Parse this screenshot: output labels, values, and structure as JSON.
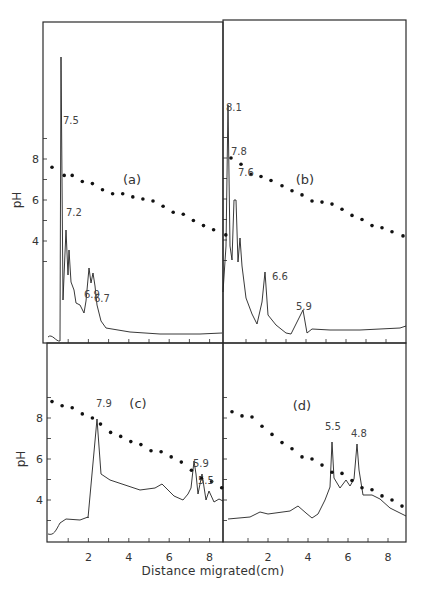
{
  "figure": {
    "xlabel": "Distance migrated(cm)",
    "ylabel": "pH"
  },
  "chart_data": [
    {
      "type": "line",
      "panel": "(a)",
      "title": "(a)",
      "xlabel": "Distance migrated (cm)",
      "ylabel": "pH",
      "ylim": [
        1.2,
        12.7
      ],
      "xlim": [
        0,
        9
      ],
      "yticks": [
        4,
        6,
        8
      ],
      "xticks": [
        2,
        4,
        6,
        8
      ],
      "peak_labels": [
        {
          "label": "7.5",
          "x": 0.7,
          "y_frac": 0.13
        },
        {
          "label": "7.2",
          "x": 1.2,
          "y_frac": 0.42
        },
        {
          "label": "6.9",
          "x": 2.2,
          "y_frac": 0.61
        },
        {
          "label": "6.7",
          "x": 2.5,
          "y_frac": 0.61
        }
      ],
      "series": [
        {
          "name": "pH gradient",
          "style": "dots",
          "x": [
            0.2,
            0.8,
            1.2,
            1.7,
            2.2,
            2.7,
            3.2,
            3.7,
            4.2,
            4.7,
            5.2,
            5.7,
            6.2,
            6.7,
            7.2,
            7.7,
            8.2,
            8.8
          ],
          "y": [
            7.6,
            7.2,
            7.2,
            6.9,
            6.8,
            6.5,
            6.3,
            6.3,
            6.15,
            6.05,
            5.95,
            5.7,
            5.4,
            5.3,
            5.0,
            4.75,
            4.55,
            4.3
          ]
        },
        {
          "name": "Absorbance trace",
          "style": "line"
        }
      ]
    },
    {
      "type": "line",
      "panel": "(b)",
      "title": "(b)",
      "xlabel": "Distance migrated (cm)",
      "ylabel": "pH",
      "xlim": [
        0,
        9
      ],
      "yticks": [
        4,
        6,
        8
      ],
      "xticks": [
        2,
        4,
        6,
        8
      ],
      "peak_labels": [
        {
          "label": "8.1",
          "x": 0.3
        },
        {
          "label": "7.8",
          "x": 0.8
        },
        {
          "label": "7.6",
          "x": 1.2
        },
        {
          "label": "6.6",
          "x": 2.4
        },
        {
          "label": "5.9",
          "x": 3.9
        }
      ],
      "series": [
        {
          "name": "pH gradient",
          "style": "dots",
          "x": [
            0.25,
            0.75,
            1.25,
            1.75,
            2.25,
            2.8,
            3.3,
            3.8,
            4.3,
            4.8,
            5.3,
            5.8,
            6.3,
            6.8,
            7.3,
            7.8,
            8.3,
            8.85
          ],
          "y": [
            8.0,
            7.7,
            7.2,
            7.1,
            6.9,
            6.65,
            6.4,
            6.2,
            5.9,
            5.85,
            5.75,
            5.5,
            5.2,
            5.0,
            4.7,
            4.6,
            4.4,
            4.2
          ]
        },
        {
          "name": "Absorbance trace",
          "style": "line"
        }
      ]
    },
    {
      "type": "line",
      "panel": "(c)",
      "title": "(c)",
      "xlabel": "Distance migrated (cm)",
      "ylabel": "pH",
      "xlim": [
        0,
        9
      ],
      "yticks": [
        4,
        6,
        8
      ],
      "xticks": [
        2,
        4,
        6,
        8
      ],
      "peak_labels": [
        {
          "label": "7.9",
          "x": 2.6
        },
        {
          "label": "5.9",
          "x": 7.0
        },
        {
          "label": "5.5",
          "x": 7.4
        }
      ],
      "series": [
        {
          "name": "pH gradient",
          "style": "dots",
          "x": [
            0.2,
            0.7,
            1.2,
            1.7,
            2.2,
            2.6,
            3.1,
            3.6,
            4.1,
            4.6,
            5.1,
            5.6,
            6.1,
            6.6,
            7.1,
            7.6,
            8.1,
            8.6
          ],
          "y": [
            8.8,
            8.6,
            8.5,
            8.2,
            8.0,
            7.7,
            7.3,
            7.1,
            6.85,
            6.7,
            6.4,
            6.35,
            6.1,
            5.85,
            5.45,
            5.05,
            4.9,
            4.6
          ]
        },
        {
          "name": "Absorbance trace",
          "style": "line"
        }
      ]
    },
    {
      "type": "line",
      "panel": "(d)",
      "title": "(d)",
      "xlabel": "Distance migrated (cm)",
      "ylabel": "pH",
      "xlim": [
        0,
        9
      ],
      "yticks": [
        4,
        6,
        8
      ],
      "xticks": [
        2,
        4,
        6,
        8
      ],
      "peak_labels": [
        {
          "label": "5.5",
          "x": 5.1
        },
        {
          "label": "4.8",
          "x": 6.5
        }
      ],
      "series": [
        {
          "name": "pH gradient",
          "style": "dots",
          "x": [
            0.2,
            0.7,
            1.2,
            1.7,
            2.2,
            2.7,
            3.2,
            3.7,
            4.2,
            4.7,
            5.2,
            5.7,
            6.2,
            6.7,
            7.2,
            7.7,
            8.2,
            8.7
          ],
          "y": [
            8.3,
            8.1,
            8.05,
            7.6,
            7.2,
            6.8,
            6.5,
            6.1,
            6.0,
            5.7,
            5.35,
            5.3,
            4.95,
            4.6,
            4.5,
            4.2,
            4.0,
            3.7
          ]
        },
        {
          "name": "Absorbance trace",
          "style": "line"
        }
      ]
    }
  ]
}
